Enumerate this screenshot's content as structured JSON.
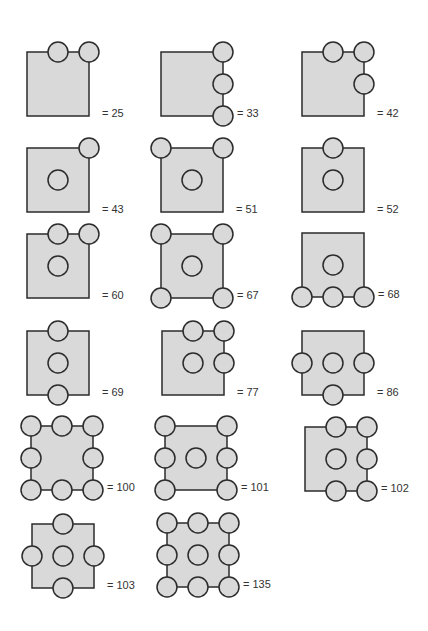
{
  "style": {
    "square_fill": "#d9d9d9",
    "square_stroke": "#2b2b2b",
    "circle_fill": "#d9d9d9",
    "circle_stroke": "#2b2b2b",
    "label_color": "#333333",
    "square_width": 62,
    "square_height": 64,
    "circle_radius": 10
  },
  "figures": [
    {
      "label": "= 25",
      "x": 27,
      "y": 52,
      "circles": [
        [
          1,
          0
        ],
        [
          2,
          0
        ]
      ]
    },
    {
      "label": "= 33",
      "x": 161,
      "y": 52,
      "circles": [
        [
          2,
          0
        ],
        [
          2,
          1
        ],
        [
          2,
          2
        ]
      ]
    },
    {
      "label": "= 42",
      "x": 302,
      "y": 52,
      "circles": [
        [
          1,
          0
        ],
        [
          2,
          0
        ],
        [
          2,
          1
        ]
      ]
    },
    {
      "label": "= 43",
      "x": 27,
      "y": 148,
      "circles": [
        [
          2,
          0
        ],
        [
          1,
          1
        ]
      ]
    },
    {
      "label": "= 51",
      "x": 161,
      "y": 148,
      "circles": [
        [
          0,
          0
        ],
        [
          2,
          0
        ],
        [
          1,
          1
        ]
      ]
    },
    {
      "label": "= 52",
      "x": 302,
      "y": 148,
      "circles": [
        [
          1,
          0
        ],
        [
          1,
          1
        ]
      ]
    },
    {
      "label": "= 60",
      "x": 27,
      "y": 234,
      "circles": [
        [
          1,
          0
        ],
        [
          2,
          0
        ],
        [
          1,
          1
        ]
      ]
    },
    {
      "label": "= 67",
      "x": 161,
      "y": 234,
      "circles": [
        [
          0,
          0
        ],
        [
          2,
          0
        ],
        [
          1,
          1
        ],
        [
          0,
          2
        ],
        [
          2,
          2
        ]
      ]
    },
    {
      "label": "= 68",
      "x": 302,
      "y": 233,
      "circles": [
        [
          1,
          1
        ],
        [
          0,
          2
        ],
        [
          1,
          2
        ],
        [
          2,
          2
        ]
      ]
    },
    {
      "label": "= 69",
      "x": 27,
      "y": 331,
      "circles": [
        [
          1,
          0
        ],
        [
          1,
          1
        ],
        [
          1,
          2
        ]
      ]
    },
    {
      "label": "= 77",
      "x": 162,
      "y": 331,
      "circles": [
        [
          1,
          0
        ],
        [
          2,
          0
        ],
        [
          1,
          1
        ],
        [
          2,
          1
        ]
      ]
    },
    {
      "label": "= 86",
      "x": 302,
      "y": 331,
      "circles": [
        [
          0,
          1
        ],
        [
          1,
          1
        ],
        [
          2,
          1
        ],
        [
          1,
          2
        ]
      ]
    },
    {
      "label": "= 100",
      "x": 31,
      "y": 426,
      "circles": [
        [
          0,
          0
        ],
        [
          1,
          0
        ],
        [
          2,
          0
        ],
        [
          0,
          1
        ],
        [
          2,
          1
        ],
        [
          0,
          2
        ],
        [
          1,
          2
        ],
        [
          2,
          2
        ]
      ]
    },
    {
      "label": "= 101",
      "x": 165,
      "y": 426,
      "circles": [
        [
          0,
          0
        ],
        [
          2,
          0
        ],
        [
          0,
          1
        ],
        [
          1,
          1
        ],
        [
          2,
          1
        ],
        [
          0,
          2
        ],
        [
          2,
          2
        ]
      ]
    },
    {
      "label": "= 102",
      "x": 305,
      "y": 427,
      "circles": [
        [
          1,
          0
        ],
        [
          2,
          0
        ],
        [
          1,
          1
        ],
        [
          2,
          1
        ],
        [
          1,
          2
        ],
        [
          2,
          2
        ]
      ]
    },
    {
      "label": "= 103",
      "x": 32,
      "y": 524,
      "circles": [
        [
          1,
          0
        ],
        [
          0,
          1
        ],
        [
          1,
          1
        ],
        [
          2,
          1
        ],
        [
          1,
          2
        ]
      ]
    },
    {
      "label": "= 135",
      "x": 167,
      "y": 523,
      "circles": [
        [
          0,
          0
        ],
        [
          1,
          0
        ],
        [
          2,
          0
        ],
        [
          0,
          1
        ],
        [
          1,
          1
        ],
        [
          2,
          1
        ],
        [
          0,
          2
        ],
        [
          1,
          2
        ],
        [
          2,
          2
        ]
      ]
    }
  ]
}
